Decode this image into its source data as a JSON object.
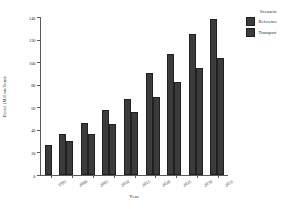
{
  "chart_data": {
    "type": "bar",
    "title": "",
    "xlabel": "Year",
    "ylabel": "Diesel (Million Tons)",
    "categories": [
      "1995",
      "2000",
      "2005",
      "2010",
      "2015",
      "2020",
      "2025",
      "2030",
      "2035"
    ],
    "series": [
      {
        "name": "Reference",
        "values": [
          27,
          36,
          46,
          58,
          67,
          90,
          107,
          125,
          138
        ]
      },
      {
        "name": "Transport",
        "values": [
          27,
          30,
          36,
          45,
          56,
          69,
          82,
          95,
          104
        ]
      }
    ],
    "ylim": [
      0,
      140
    ],
    "yticks": [
      0,
      20,
      40,
      60,
      80,
      100,
      120,
      140
    ],
    "grid": false,
    "legend": {
      "title": "Scenario",
      "position": "right",
      "entries": [
        "Reference",
        "Transport"
      ]
    },
    "colors": {
      "reference": "#3b3b3b",
      "transport": "#3b3b3b",
      "axis": "#5a5a5a",
      "background": "#ffffff"
    }
  }
}
